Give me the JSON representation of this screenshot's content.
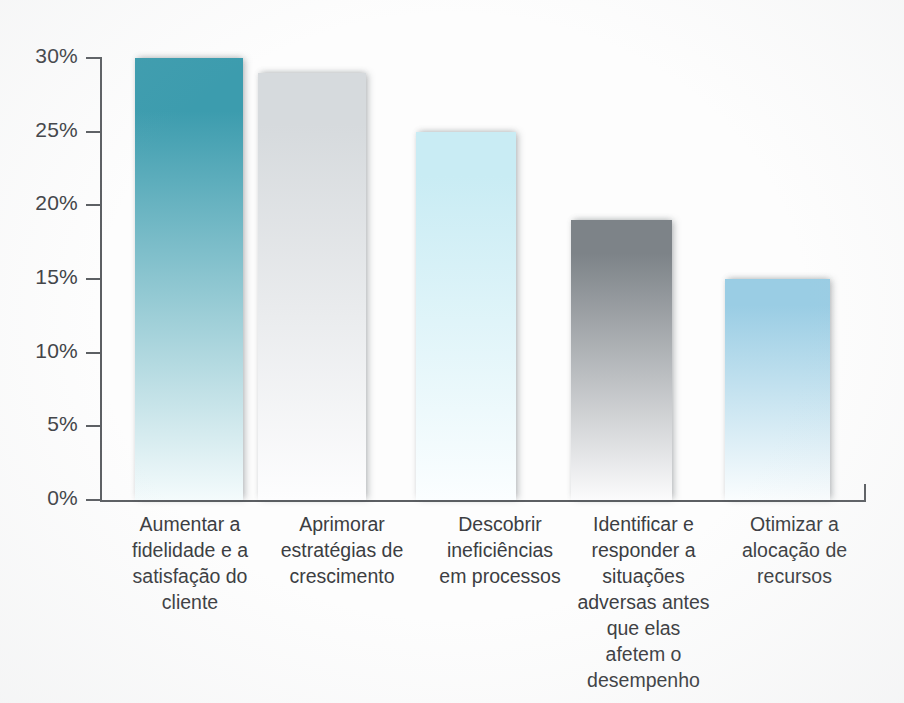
{
  "chart_data": {
    "type": "bar",
    "title": "",
    "xlabel": "",
    "ylabel": "",
    "ylim": [
      0,
      30
    ],
    "grid": false,
    "legend": "none",
    "ytick_labels": [
      "30%",
      "25%",
      "20%",
      "15%",
      "10%",
      "5%",
      "0%"
    ],
    "ytick_values": [
      30,
      25,
      20,
      15,
      10,
      5,
      0
    ],
    "categories": [
      "Aumentar a\nfidelidade e a\nsatisfação do\ncliente",
      "Aprimorar\nestratégias de\ncrescimento",
      "Descobrir\nineficiências\nem processos",
      "Identificar e\nresponder a\nsituações\nadversas antes\nque elas\nafetem o\ndesempenho",
      "Otimizar a\nalocação de\nrecursos"
    ],
    "values": [
      30,
      29,
      25,
      19,
      15
    ],
    "value_labels": [
      "30%",
      "29%",
      "25%",
      "19%",
      "15%"
    ],
    "bar_colors_top": [
      "#3c9cae",
      "#d6dadd",
      "#c9ecf4",
      "#7d8388",
      "#9acde4"
    ],
    "bar_colors_bottom": [
      "#f4fbfc",
      "#fdfdfe",
      "#fbfeff",
      "#fbfbfc",
      "#fafdfe"
    ]
  },
  "axis": {
    "y_axis_name": "percentage-axis",
    "x_axis_name": "category-axis"
  }
}
